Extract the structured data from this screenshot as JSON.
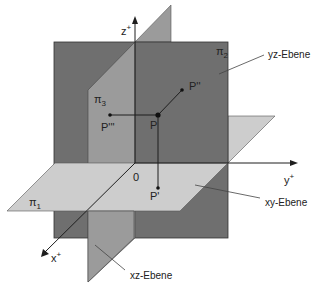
{
  "diagram": {
    "type": "3d-coordinate-planes",
    "colors": {
      "background": "#ffffff",
      "yz_plane": "#6f6f6f",
      "xz_plane": "#9b9b9b",
      "xy_plane": "#cdcdcd",
      "lines": "#1e1e1e"
    },
    "axes": {
      "x": "x",
      "x_sup": "+",
      "y": "y",
      "y_sup": "+",
      "z": "z",
      "z_sup": "+",
      "origin": "0"
    },
    "planes": {
      "pi1": {
        "symbol": "π",
        "sub": "1",
        "label": "xy-Ebene"
      },
      "pi2": {
        "symbol": "π",
        "sub": "2",
        "label": "yz-Ebene"
      },
      "pi3": {
        "symbol": "π",
        "sub": "3",
        "label": "xz-Ebene"
      }
    },
    "points": {
      "P": "P",
      "P1": "P'",
      "P2": "P''",
      "P3": "P'''"
    }
  }
}
